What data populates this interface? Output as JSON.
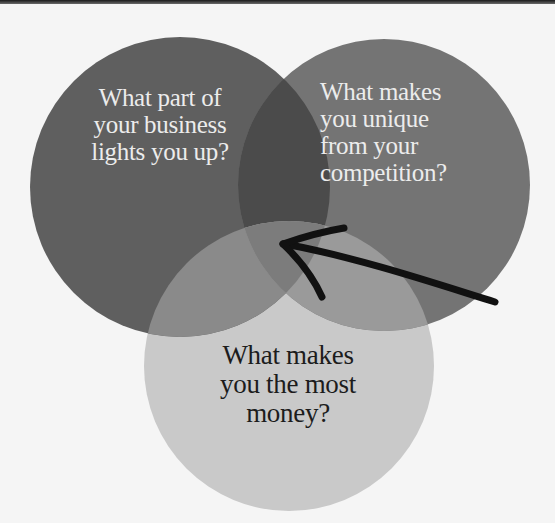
{
  "diagram": {
    "type": "venn",
    "circles": [
      {
        "id": "left",
        "lines": [
          "What part of",
          "your business",
          "lights you up?"
        ],
        "text": "What part of your business lights you up?",
        "color": "#5f5f5f",
        "text_color": "#ececec"
      },
      {
        "id": "right",
        "lines": [
          "What makes",
          "you unique",
          "from your",
          "competition?"
        ],
        "text": "What makes you unique from your competition?",
        "color": "#747474",
        "text_color": "#ececec"
      },
      {
        "id": "bottom",
        "lines": [
          "What makes",
          "you the most",
          "money?"
        ],
        "text": "What makes you the most money?",
        "color": "#c9c9c9",
        "text_color": "#1c1c1c"
      }
    ],
    "overlap_colors": {
      "left_right": "#4b4b4b",
      "left_bottom": "#8a8a8a",
      "right_bottom": "#999999",
      "center": "#7a7a7a"
    },
    "annotation": {
      "type": "hand-drawn-arrow",
      "points_to": "center overlap",
      "color": "#111111"
    }
  },
  "colors": {
    "background": "#f5f5f5"
  }
}
